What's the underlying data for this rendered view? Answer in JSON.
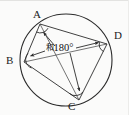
{
  "figure": {
    "kind": "geometry-diagram",
    "background_color": "#fbfbfa",
    "stroke_color": "#2b2b2b",
    "text_color": "#1c1c1c",
    "width": 129,
    "height": 115,
    "circle": {
      "cx": 66,
      "cy": 60,
      "r": 46
    },
    "vertices": [
      {
        "id": "A",
        "label": "A",
        "x": 40,
        "y": 24,
        "label_x": 33,
        "label_y": 9
      },
      {
        "id": "B",
        "label": "B",
        "x": 24,
        "y": 62,
        "label_x": 6,
        "label_y": 55
      },
      {
        "id": "C",
        "label": "C",
        "x": 79,
        "y": 100,
        "label_x": 68,
        "label_y": 101
      },
      {
        "id": "D",
        "label": "D",
        "x": 107,
        "y": 44,
        "label_x": 114,
        "label_y": 30
      }
    ],
    "quadrilateral_sides": [
      {
        "from": "A",
        "to": "B"
      },
      {
        "from": "B",
        "to": "C"
      },
      {
        "from": "C",
        "to": "D"
      },
      {
        "from": "D",
        "to": "A"
      }
    ],
    "diagonals": [
      {
        "from": "A",
        "to": "C"
      },
      {
        "from": "B",
        "to": "D"
      }
    ],
    "angle_marks": [
      {
        "at": "A"
      },
      {
        "at": "B"
      },
      {
        "at": "C"
      },
      {
        "at": "D"
      }
    ],
    "annotation": {
      "prefix": "和",
      "value": "180",
      "unit": "°",
      "full_text": "和180°",
      "x": 46,
      "y": 43
    },
    "arrows": [
      {
        "from_x": 55,
        "from_y": 46,
        "to_x": 43,
        "to_y": 32,
        "points_to": "A"
      },
      {
        "from_x": 45,
        "from_y": 51,
        "to_x": 30,
        "to_y": 56,
        "points_to": "B"
      },
      {
        "from_x": 70,
        "from_y": 53,
        "to_x": 80,
        "to_y": 92,
        "points_to": "C"
      },
      {
        "from_x": 76,
        "from_y": 48,
        "to_x": 99,
        "to_y": 42,
        "points_to": "D"
      }
    ]
  }
}
